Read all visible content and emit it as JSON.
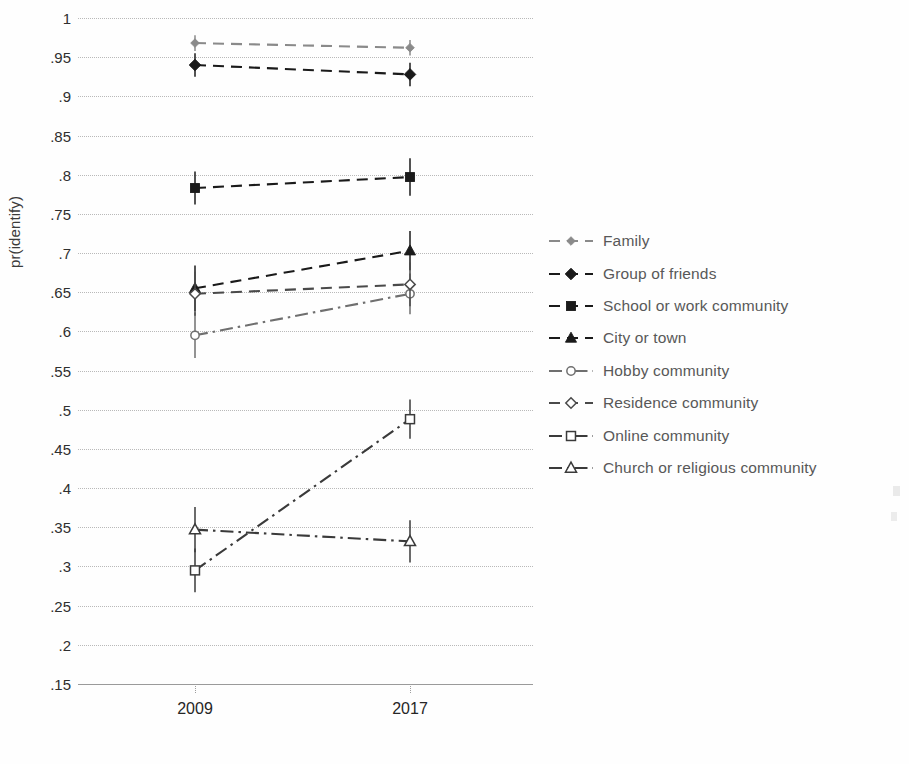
{
  "chart_data": {
    "type": "line",
    "title": "",
    "subtitle": "",
    "xlabel": "",
    "ylabel": "pr(identify)",
    "categories": [
      "2009",
      "2017"
    ],
    "x": [
      2009,
      2017
    ],
    "ylim": [
      0.15,
      1.0
    ],
    "ytick_labels": [
      "1",
      ".95",
      ".9",
      ".85",
      ".8",
      ".75",
      ".7",
      ".65",
      ".6",
      ".55",
      ".5",
      ".45",
      ".4",
      ".35",
      ".3",
      ".25",
      ".2",
      ".15"
    ],
    "ytick_values": [
      1,
      0.95,
      0.9,
      0.85,
      0.8,
      0.75,
      0.7,
      0.65,
      0.6,
      0.55,
      0.5,
      0.45,
      0.4,
      0.35,
      0.3,
      0.25,
      0.2,
      0.15
    ],
    "xtick_labels": [
      "2009",
      "2017"
    ],
    "grid": "horizontal-dotted",
    "legend_position": "right",
    "error_bars": true,
    "series": [
      {
        "name": "Family",
        "marker": "filled-diamond-small",
        "line": "dashed",
        "color": "#8a8a8a",
        "values": [
          0.968,
          0.962
        ],
        "error_low": [
          0.958,
          0.952
        ],
        "error_high": [
          0.978,
          0.972
        ]
      },
      {
        "name": "Group of friends",
        "marker": "filled-diamond",
        "line": "dashed",
        "color": "#1a1a1a",
        "values": [
          0.94,
          0.928
        ],
        "error_low": [
          0.925,
          0.913
        ],
        "error_high": [
          0.955,
          0.943
        ]
      },
      {
        "name": "School or work community",
        "marker": "filled-square",
        "line": "dashed",
        "color": "#1a1a1a",
        "values": [
          0.783,
          0.797
        ],
        "error_low": [
          0.762,
          0.773
        ],
        "error_high": [
          0.804,
          0.821
        ]
      },
      {
        "name": "City or town",
        "marker": "filled-triangle",
        "line": "dashed",
        "color": "#1a1a1a",
        "values": [
          0.655,
          0.703
        ],
        "error_low": [
          0.626,
          0.678
        ],
        "error_high": [
          0.684,
          0.728
        ]
      },
      {
        "name": "Hobby community",
        "marker": "open-circle",
        "line": "dash-dot",
        "color": "#6f6f6f",
        "values": [
          0.595,
          0.648
        ],
        "error_low": [
          0.566,
          0.622
        ],
        "error_high": [
          0.624,
          0.674
        ]
      },
      {
        "name": "Residence community",
        "marker": "open-diamond",
        "line": "dashed",
        "color": "#4a4a4a",
        "values": [
          0.648,
          0.66
        ],
        "error_low": [
          0.62,
          0.632
        ],
        "error_high": [
          0.676,
          0.688
        ]
      },
      {
        "name": "Online community",
        "marker": "open-square",
        "line": "dash-dot",
        "color": "#3a3a3a",
        "values": [
          0.295,
          0.488
        ],
        "error_low": [
          0.267,
          0.463
        ],
        "error_high": [
          0.323,
          0.513
        ]
      },
      {
        "name": "Church or religious community",
        "marker": "open-triangle",
        "line": "dash-dot",
        "color": "#3a3a3a",
        "values": [
          0.347,
          0.332
        ],
        "error_low": [
          0.318,
          0.305
        ],
        "error_high": [
          0.376,
          0.359
        ]
      }
    ]
  },
  "legend": {
    "items": [
      {
        "label": "Family"
      },
      {
        "label": "Group of friends"
      },
      {
        "label": "School or work community"
      },
      {
        "label": "City or town"
      },
      {
        "label": "Hobby community"
      },
      {
        "label": "Residence community"
      },
      {
        "label": "Online community"
      },
      {
        "label": "Church or religious community"
      }
    ]
  }
}
